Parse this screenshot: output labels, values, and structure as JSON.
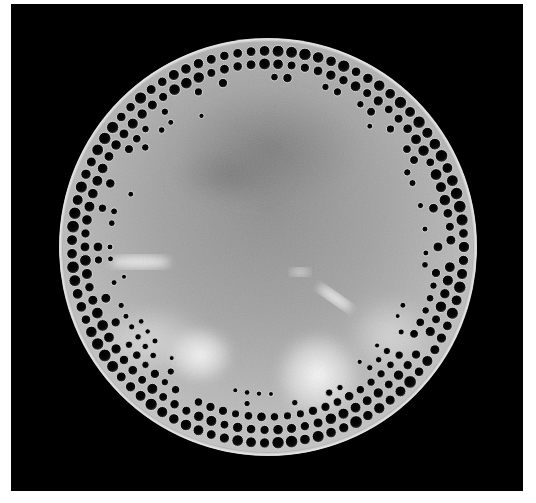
{
  "image": {
    "subject": "circular diatom valve (light/electron micrograph)",
    "background_color": "#000000",
    "page_background": "#ffffff",
    "valve": {
      "center": [
        268,
        247
      ],
      "radius": 209,
      "rim_color": "#d8d8d8",
      "surface_color": "#a9a9a9",
      "center_shade": "#8c8c8c",
      "bright_patch_color": "#f4f4f4",
      "pore_color": "#050505",
      "pore_rows": 4,
      "description": "Disc with smooth raised rim; marginal band of round perforations (areolae) in 3-4 concentric rows, smaller pores trailing inward in scalloped clusters; mottled grey central area with darker zone at upper center and bright diffuse patches at lower left and lower center"
    }
  }
}
